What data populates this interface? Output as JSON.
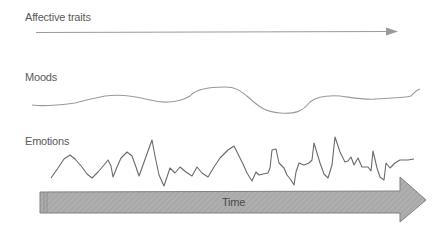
{
  "diagram": {
    "rows": [
      {
        "label": "Affective traits"
      },
      {
        "label": "Moods"
      },
      {
        "label": "Emotions"
      }
    ],
    "time_arrow": {
      "label": "Time"
    },
    "colors": {
      "text": "#5a5a5a",
      "trait_line": "#9a9a9a",
      "mood_line": "#9a9a9a",
      "emotion_line": "#6a6a6a",
      "time_fill": "#a8a8a8",
      "time_stroke": "#808080"
    }
  }
}
